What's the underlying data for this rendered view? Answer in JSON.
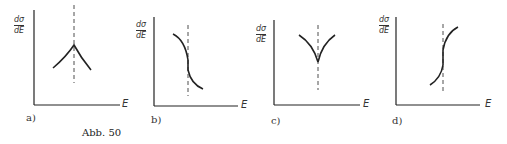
{
  "figure": {
    "caption": "Abb. 50",
    "y_axis_label": {
      "numerator": "dσ",
      "denominator": "dE"
    },
    "x_axis_label": "E",
    "panels": [
      {
        "id": "a",
        "label": "a)",
        "shape": "upward cusp (peak) at threshold"
      },
      {
        "id": "b",
        "label": "b)",
        "shape": "decreasing step with infinite slope at threshold"
      },
      {
        "id": "c",
        "label": "c)",
        "shape": "downward cusp (dip) at threshold"
      },
      {
        "id": "d",
        "label": "d)",
        "shape": "increasing step with infinite slope at threshold"
      }
    ]
  },
  "colors": {
    "ink": "#222222",
    "background": "#ffffff"
  }
}
